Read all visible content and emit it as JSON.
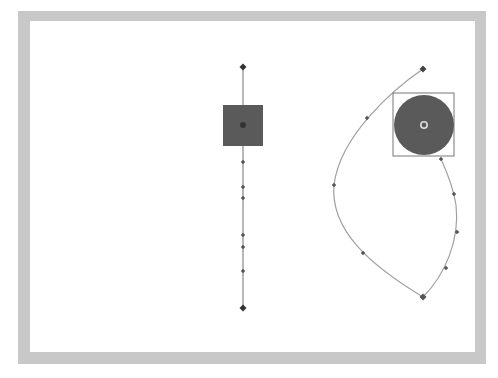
{
  "canvas": {
    "width": 498,
    "height": 378,
    "frame_color": "#c8c8c8",
    "stage_color": "#ffffff"
  },
  "colors": {
    "path_line": "#909090",
    "keyframe_dot": "#333333",
    "frame_dot": "#555555",
    "tween_object": "#5a5a5a",
    "bbox_outline": "#777777",
    "registration_ring": "#dddddd"
  },
  "linear_path": {
    "x": 243,
    "start": {
      "x": 243,
      "y": 67
    },
    "end": {
      "x": 243,
      "y": 308
    },
    "frame_dots_y": [
      162,
      187,
      198,
      235,
      247,
      271
    ],
    "object": {
      "shape": "square",
      "x": 223,
      "y": 105,
      "width": 40,
      "height": 41,
      "center": {
        "x": 243,
        "y": 125
      }
    }
  },
  "curved_path": {
    "start": {
      "x": 423,
      "y": 69
    },
    "end": {
      "x": 423,
      "y": 297
    },
    "frame_dots": [
      {
        "x": 367,
        "y": 118
      },
      {
        "x": 334,
        "y": 185
      },
      {
        "x": 363,
        "y": 253
      },
      {
        "x": 446,
        "y": 268
      },
      {
        "x": 457,
        "y": 232
      },
      {
        "x": 454,
        "y": 194
      },
      {
        "x": 441,
        "y": 159
      }
    ],
    "object": {
      "shape": "circle",
      "cx": 424,
      "cy": 125,
      "r": 30,
      "bbox": {
        "x": 393,
        "y": 93,
        "width": 61,
        "height": 63
      }
    }
  }
}
